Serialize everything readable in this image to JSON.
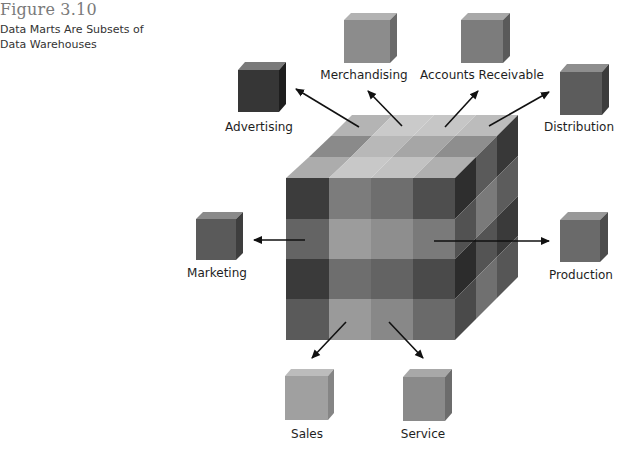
{
  "figure": {
    "number": "Figure 3.10",
    "caption": "Data Marts Are Subsets of Data Warehouses"
  },
  "diagram": {
    "center": "Data Warehouse cube (4x4x4 grid)",
    "data_marts": [
      {
        "id": "advertising",
        "label": "Advertising",
        "shade": "#3a3a3a"
      },
      {
        "id": "merchandising",
        "label": "Merchandising",
        "shade": "#8c8c8c"
      },
      {
        "id": "accounts-receivable",
        "label": "Accounts Receivable",
        "shade": "#7e7e7e"
      },
      {
        "id": "distribution",
        "label": "Distribution",
        "shade": "#5e5e5e"
      },
      {
        "id": "marketing",
        "label": "Marketing",
        "shade": "#5a5a5a"
      },
      {
        "id": "production",
        "label": "Production",
        "shade": "#6c6c6c"
      },
      {
        "id": "sales",
        "label": "Sales",
        "shade": "#a0a0a0"
      },
      {
        "id": "service",
        "label": "Service",
        "shade": "#8a8a8a"
      }
    ]
  }
}
